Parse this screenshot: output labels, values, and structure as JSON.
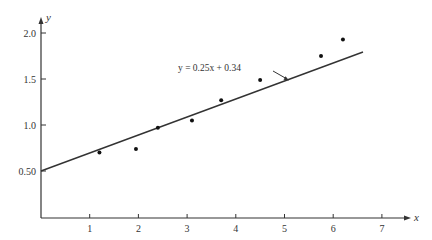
{
  "chart_data": {
    "type": "scatter",
    "title": "",
    "xlabel": "x",
    "ylabel": "y",
    "xlim": [
      0,
      7.5
    ],
    "ylim": [
      0,
      2.2
    ],
    "grid": false,
    "legend": null,
    "x_ticks": [
      1,
      2,
      3,
      4,
      5,
      6,
      7
    ],
    "x_tick_labels": [
      "1",
      "2",
      "3",
      "4",
      "5",
      "6",
      "7"
    ],
    "y_ticks": [
      0.5,
      1.0,
      1.5,
      2.0
    ],
    "y_tick_labels": [
      "0.50",
      "1.0",
      "1.5",
      "2.0"
    ],
    "series": [
      {
        "name": "data points",
        "type": "scatter",
        "x": [
          1.2,
          1.95,
          2.4,
          3.1,
          3.7,
          4.5,
          5.75,
          6.2
        ],
        "y": [
          0.7,
          0.74,
          0.97,
          1.05,
          1.27,
          1.49,
          1.75,
          1.93
        ]
      },
      {
        "name": "fit line",
        "type": "line",
        "slope": 0.25,
        "intercept": 0.34,
        "x_range": [
          0,
          6.6
        ]
      }
    ],
    "annotations": [
      {
        "text": "y = 0.25x + 0.34",
        "points_to": "fit line"
      }
    ]
  },
  "labels": {
    "x_axis": "x",
    "y_axis": "y",
    "equation": "y = 0.25x + 0.34"
  }
}
